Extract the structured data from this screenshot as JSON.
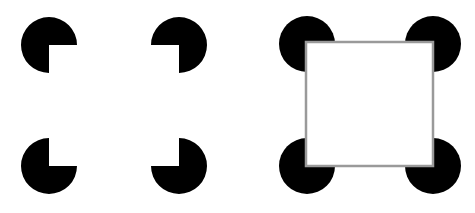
{
  "figure": {
    "background": "#ffffff",
    "inducer_color": "#000000",
    "outline_color": "#9a9a9a",
    "radius": 28,
    "left_panel": {
      "label": "illusory square",
      "inducers": [
        {
          "name": "top-left",
          "cx": 49,
          "cy": 45
        },
        {
          "name": "top-right",
          "cx": 179,
          "cy": 45
        },
        {
          "name": "bottom-left",
          "cx": 49,
          "cy": 166
        },
        {
          "name": "bottom-right",
          "cx": 179,
          "cy": 166
        }
      ]
    },
    "right_panel": {
      "label": "outlined square",
      "inducers": [
        {
          "name": "top-left",
          "cx": 307,
          "cy": 44
        },
        {
          "name": "top-right",
          "cx": 433,
          "cy": 44
        },
        {
          "name": "bottom-left",
          "cx": 307,
          "cy": 166
        },
        {
          "name": "bottom-right",
          "cx": 433,
          "cy": 166
        }
      ],
      "square": {
        "x": 306,
        "y": 42,
        "w": 127,
        "h": 124
      }
    }
  }
}
